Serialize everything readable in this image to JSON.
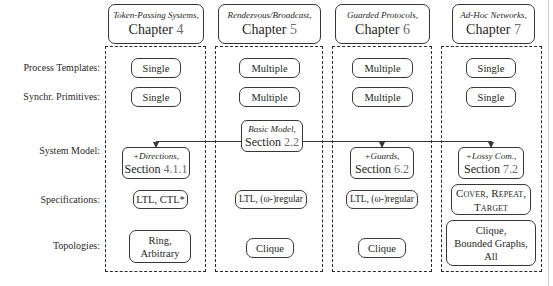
{
  "figure": {
    "row_labels": [
      "Process Templates:",
      "Synchr. Primitives:",
      "System Model:",
      "Specifications:",
      "Topologies:"
    ],
    "columns": [
      {
        "header_title": "Token-Passing Systems,",
        "header_label": "Chapter",
        "header_number": "4",
        "process_templates": "Single",
        "synchr_primitives": "Single",
        "system_model_top": "+Directions,",
        "system_model_label": "Section",
        "system_model_number": "4.1.1",
        "specifications": [
          "LTL, CTL*"
        ],
        "topologies": [
          "Ring,",
          "Arbitrary"
        ]
      },
      {
        "header_title": "Rendezvous/Broadcast,",
        "header_label": "Chapter",
        "header_number": "5",
        "process_templates": "Multiple",
        "synchr_primitives": "Multiple",
        "system_model_top": "Basic Model,",
        "system_model_label": "Section",
        "system_model_number": "2.2",
        "specifications": [
          "LTL, (ω-)regular"
        ],
        "topologies": [
          "Clique"
        ]
      },
      {
        "header_title": "Guarded Protocols,",
        "header_label": "Chapter",
        "header_number": "6",
        "process_templates": "Multiple",
        "synchr_primitives": "Multiple",
        "system_model_top": "+Guards,",
        "system_model_label": "Section",
        "system_model_number": "6.2",
        "specifications": [
          "LTL, (ω-)regular"
        ],
        "topologies": [
          "Clique"
        ]
      },
      {
        "header_title": "Ad-Hoc Networks,",
        "header_label": "Chapter",
        "header_number": "7",
        "process_templates": "Single",
        "synchr_primitives": "Single",
        "system_model_top": "+Lossy Com.,",
        "system_model_label": "Section",
        "system_model_number": "7.2",
        "specifications": [
          "Cover, Repeat,",
          "Target"
        ],
        "topologies": [
          "Clique,",
          "Bounded Graphs,",
          "All"
        ]
      }
    ],
    "colors": {
      "text": "#231f20",
      "number": "#6d6a68",
      "rule": "#3a3634",
      "background": "#ffffff"
    }
  }
}
